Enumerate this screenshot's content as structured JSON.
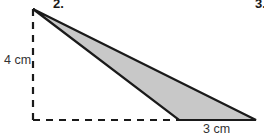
{
  "figure": {
    "problem_number": "2.",
    "next_problem_number": "3.",
    "height_label": "4 cm",
    "base_label": "3 cm",
    "shape": "triangle",
    "fill_color": "#c8c8c8",
    "stroke_color": "#1a1a1a",
    "background_color": "#ffffff",
    "vertices": {
      "apex": [
        33,
        9
      ],
      "base_left": [
        179,
        120
      ],
      "base_right": [
        256,
        120
      ]
    },
    "dashed_height_line": {
      "from": [
        33,
        9
      ],
      "to": [
        33,
        120
      ]
    },
    "dashed_base_line": {
      "from": [
        33,
        120
      ],
      "to": [
        179,
        120
      ]
    }
  }
}
